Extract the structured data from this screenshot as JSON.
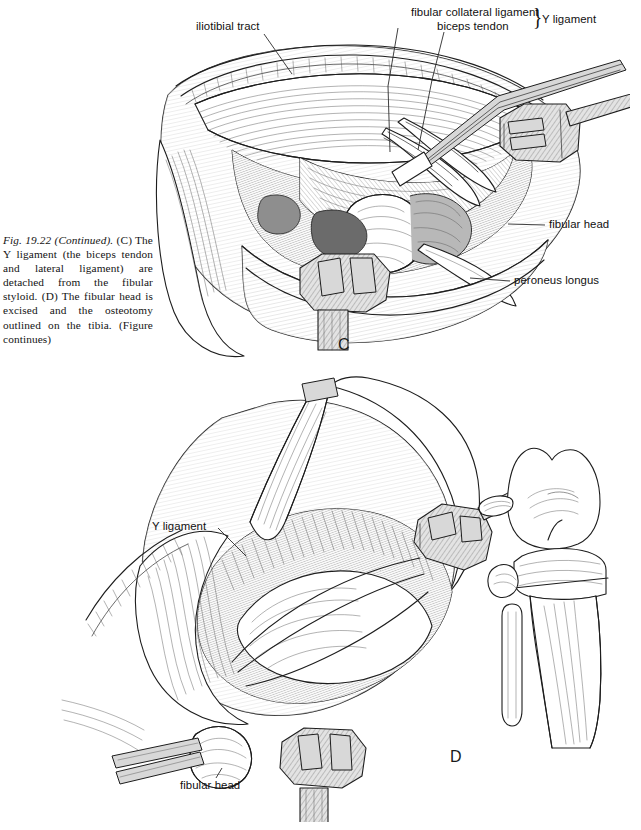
{
  "page": {
    "background_color": "#ffffff",
    "ink_color": "#1d1d1d",
    "width": 641,
    "height": 830
  },
  "caption": {
    "figure_number": "Fig. 19.22 (Continued).",
    "body": " (C) The Y ligament (the biceps tendon and lateral ligament) are detached from the fibular styloid. (D) The fibular head is excised and the osteotomy outlined on the tibia. (Figure continues)"
  },
  "panel_c": {
    "letter": "C",
    "labels": {
      "iliotibial_tract": "iliotibial tract",
      "fibular_collateral_ligament": "fibular collateral ligament",
      "biceps_tendon": "biceps tendon",
      "y_ligament": "Y ligament",
      "brace": "}",
      "fibular_head": "fibular head",
      "peroneus_longus": "peroneus longus"
    }
  },
  "panel_d": {
    "letter": "D",
    "labels": {
      "y_ligament": "Y ligament",
      "fibular_head": "fibular head"
    }
  }
}
